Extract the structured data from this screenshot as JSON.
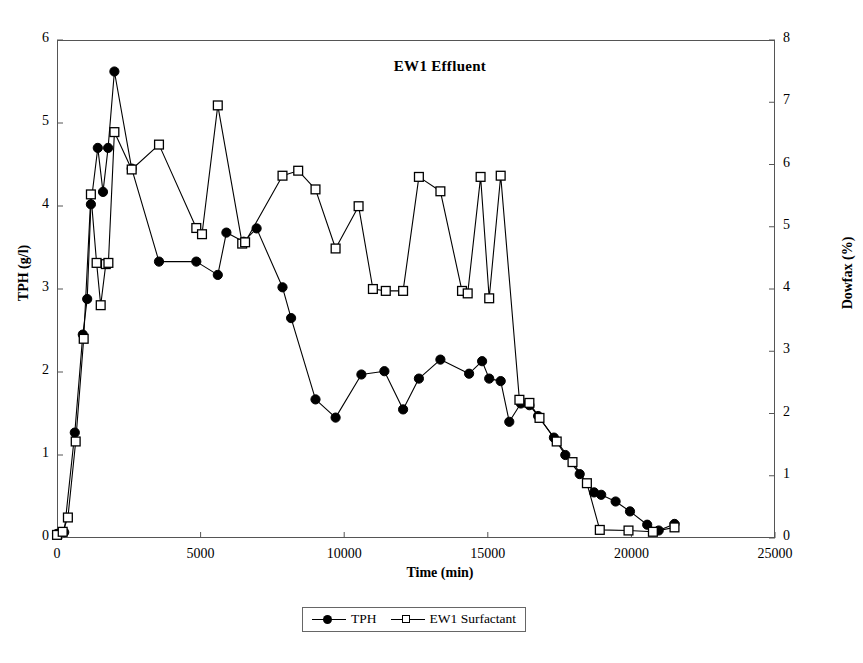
{
  "chart_data": {
    "type": "line",
    "title": "EW1 Effluent",
    "xlabel": "Time (min)",
    "ylabel": "TPH (g/l)",
    "y2label": "Dowfax (%)",
    "xlim": [
      0,
      25000
    ],
    "ylim": [
      0,
      6
    ],
    "y2lim": [
      0,
      8
    ],
    "xticks": [
      0,
      5000,
      10000,
      15000,
      20000,
      25000
    ],
    "yticks": [
      0,
      1,
      2,
      3,
      4,
      5,
      6
    ],
    "y2ticks": [
      0,
      1,
      2,
      3,
      4,
      5,
      6,
      7,
      8
    ],
    "grid": false,
    "legend_position": "below-axes",
    "series": [
      {
        "name": "TPH",
        "axis": "left",
        "marker": "filled-circle",
        "color": "#000000",
        "points": [
          [
            0,
            0.05
          ],
          [
            250,
            0.07
          ],
          [
            620,
            1.27
          ],
          [
            900,
            2.45
          ],
          [
            1050,
            2.88
          ],
          [
            1180,
            4.02
          ],
          [
            1420,
            4.7
          ],
          [
            1600,
            4.17
          ],
          [
            1780,
            4.7
          ],
          [
            2000,
            5.62
          ],
          [
            2600,
            4.45
          ],
          [
            3550,
            3.33
          ],
          [
            4850,
            3.33
          ],
          [
            5600,
            3.17
          ],
          [
            5900,
            3.68
          ],
          [
            6500,
            3.57
          ],
          [
            6950,
            3.73
          ],
          [
            7850,
            3.02
          ],
          [
            8150,
            2.65
          ],
          [
            9000,
            1.67
          ],
          [
            9700,
            1.45
          ],
          [
            10600,
            1.97
          ],
          [
            11400,
            2.01
          ],
          [
            12050,
            1.55
          ],
          [
            12600,
            1.92
          ],
          [
            13350,
            2.15
          ],
          [
            14350,
            1.98
          ],
          [
            14800,
            2.13
          ],
          [
            15050,
            1.92
          ],
          [
            15450,
            1.89
          ],
          [
            15750,
            1.4
          ],
          [
            16150,
            1.62
          ],
          [
            16450,
            1.6
          ],
          [
            16750,
            1.47
          ],
          [
            17300,
            1.21
          ],
          [
            17700,
            1.0
          ],
          [
            18200,
            0.77
          ],
          [
            18700,
            0.55
          ],
          [
            18950,
            0.52
          ],
          [
            19450,
            0.44
          ],
          [
            19950,
            0.32
          ],
          [
            20550,
            0.16
          ],
          [
            20950,
            0.09
          ],
          [
            21500,
            0.17
          ]
        ]
      },
      {
        "name": "EW1 Surfactant",
        "axis": "right",
        "marker": "open-square",
        "color": "#000000",
        "points": [
          [
            0,
            0.05
          ],
          [
            200,
            0.1
          ],
          [
            380,
            0.33
          ],
          [
            650,
            1.55
          ],
          [
            930,
            3.2
          ],
          [
            1180,
            5.52
          ],
          [
            1380,
            4.42
          ],
          [
            1520,
            3.74
          ],
          [
            1700,
            4.4
          ],
          [
            1790,
            4.42
          ],
          [
            2000,
            6.52
          ],
          [
            2600,
            5.92
          ],
          [
            3550,
            6.32
          ],
          [
            4850,
            4.98
          ],
          [
            5050,
            4.88
          ],
          [
            5600,
            6.95
          ],
          [
            6450,
            4.73
          ],
          [
            6550,
            4.75
          ],
          [
            7850,
            5.82
          ],
          [
            8400,
            5.9
          ],
          [
            9000,
            5.6
          ],
          [
            9700,
            4.65
          ],
          [
            10500,
            5.33
          ],
          [
            11000,
            4.0
          ],
          [
            11450,
            3.97
          ],
          [
            12050,
            3.97
          ],
          [
            12600,
            5.8
          ],
          [
            13350,
            5.57
          ],
          [
            14100,
            3.97
          ],
          [
            14300,
            3.93
          ],
          [
            14750,
            5.8
          ],
          [
            15050,
            3.85
          ],
          [
            15450,
            5.82
          ],
          [
            16100,
            2.22
          ],
          [
            16450,
            2.17
          ],
          [
            16800,
            1.93
          ],
          [
            17400,
            1.55
          ],
          [
            17950,
            1.22
          ],
          [
            18450,
            0.88
          ],
          [
            18900,
            0.13
          ],
          [
            19900,
            0.12
          ],
          [
            20750,
            0.1
          ],
          [
            21500,
            0.17
          ]
        ]
      }
    ]
  },
  "legend": {
    "items": [
      {
        "label": "TPH",
        "marker": "filled-circle"
      },
      {
        "label": "EW1 Surfactant",
        "marker": "open-square"
      }
    ]
  },
  "axes": {
    "x_tick_labels": [
      "0",
      "5000",
      "10000",
      "15000",
      "20000",
      "25000"
    ],
    "y_left_tick_labels": [
      "0",
      "1",
      "2",
      "3",
      "4",
      "5",
      "6"
    ],
    "y_right_tick_labels": [
      "0",
      "1",
      "2",
      "3",
      "4",
      "5",
      "6",
      "7",
      "8"
    ]
  },
  "style": {
    "axis_color": "#555555",
    "series_color": "#000000",
    "background": "#ffffff"
  }
}
